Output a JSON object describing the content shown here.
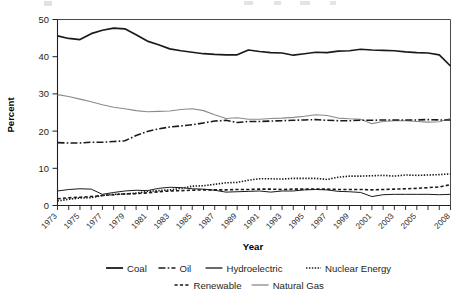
{
  "chart_data": {
    "type": "line",
    "title": "",
    "xlabel": "Year",
    "ylabel": "Percent",
    "ylim": [
      0,
      50
    ],
    "yticks": [
      0,
      10,
      20,
      30,
      40,
      50
    ],
    "grid": false,
    "legend_position": "bottom",
    "x": [
      1973,
      1974,
      1975,
      1976,
      1977,
      1978,
      1979,
      1980,
      1981,
      1982,
      1983,
      1984,
      1985,
      1986,
      1987,
      1988,
      1989,
      1990,
      1991,
      1992,
      1993,
      1994,
      1995,
      1996,
      1997,
      1998,
      1999,
      2000,
      2001,
      2002,
      2003,
      2004,
      2005,
      2006,
      2007,
      2008
    ],
    "xtick_labels": [
      "1973",
      "1975",
      "1977",
      "1979",
      "1981",
      "1983",
      "1985",
      "1987",
      "1989",
      "1991",
      "1993",
      "1995",
      "1997",
      "1999",
      "2001",
      "2003",
      "2005",
      "2008"
    ],
    "series": [
      {
        "name": "Coal",
        "style": "solid",
        "color": "#1a1a1a",
        "width": 1.7,
        "values": [
          45.6,
          44.9,
          44.6,
          46.2,
          47.1,
          47.7,
          47.5,
          45.9,
          44.2,
          43.2,
          42.1,
          41.6,
          41.2,
          40.8,
          40.6,
          40.5,
          40.5,
          41.8,
          41.4,
          41.1,
          41.0,
          40.4,
          40.8,
          41.2,
          41.1,
          41.5,
          41.6,
          42.0,
          41.8,
          41.7,
          41.6,
          41.3,
          41.1,
          41.0,
          40.5,
          37.5
        ]
      },
      {
        "name": "Oil",
        "style": "dashdot",
        "color": "#1a1a1a",
        "width": 1.6,
        "values": [
          16.9,
          16.8,
          16.8,
          17.0,
          17.0,
          17.2,
          17.4,
          18.8,
          19.9,
          20.6,
          21.1,
          21.4,
          21.7,
          22.2,
          22.7,
          22.9,
          22.3,
          22.6,
          22.6,
          22.7,
          22.8,
          22.9,
          23.0,
          23.1,
          22.9,
          22.8,
          22.8,
          22.9,
          22.9,
          23.0,
          23.0,
          23.0,
          23.0,
          23.1,
          23.0,
          23.0
        ]
      },
      {
        "name": "Hydroelectric",
        "style": "solid-thin",
        "color": "#1a1a1a",
        "width": 1.0,
        "values": [
          3.9,
          4.3,
          4.5,
          4.4,
          3.0,
          3.5,
          3.9,
          4.1,
          4.0,
          4.6,
          4.9,
          4.8,
          4.5,
          4.4,
          4.1,
          3.6,
          3.7,
          3.8,
          3.9,
          3.6,
          3.9,
          3.9,
          4.2,
          4.3,
          4.2,
          3.8,
          3.7,
          3.5,
          2.4,
          2.9,
          3.0,
          3.0,
          3.0,
          3.0,
          2.9,
          3.0
        ]
      },
      {
        "name": "Nuclear Energy",
        "style": "dotted",
        "color": "#1a1a1a",
        "width": 1.6,
        "values": [
          1.2,
          1.7,
          2.0,
          2.1,
          2.7,
          3.0,
          3.1,
          3.3,
          3.8,
          4.0,
          4.2,
          4.6,
          5.2,
          5.3,
          5.7,
          6.1,
          6.2,
          6.8,
          7.2,
          7.2,
          7.1,
          7.3,
          7.3,
          7.3,
          7.0,
          7.6,
          7.9,
          7.9,
          8.0,
          8.1,
          7.9,
          8.2,
          8.1,
          8.2,
          8.3,
          8.5
        ]
      },
      {
        "name": "Renewable",
        "style": "dashed",
        "color": "#1a1a1a",
        "width": 1.6,
        "values": [
          1.8,
          2.1,
          2.2,
          2.4,
          2.7,
          2.9,
          3.1,
          3.2,
          3.4,
          3.7,
          3.9,
          4.0,
          4.1,
          4.2,
          4.2,
          4.2,
          4.3,
          4.3,
          4.4,
          4.4,
          4.3,
          4.4,
          4.4,
          4.4,
          4.4,
          4.3,
          4.3,
          4.3,
          4.2,
          4.3,
          4.4,
          4.5,
          4.6,
          4.8,
          5.0,
          5.6
        ]
      },
      {
        "name": "Natural Gas",
        "style": "solid-gray",
        "color": "#8a8a8a",
        "width": 1.1,
        "values": [
          29.8,
          29.3,
          28.6,
          27.9,
          27.1,
          26.4,
          26.0,
          25.5,
          25.2,
          25.3,
          25.4,
          25.8,
          26.0,
          25.5,
          24.4,
          23.4,
          23.6,
          23.2,
          23.2,
          23.4,
          23.5,
          23.7,
          24.0,
          24.4,
          24.2,
          23.5,
          23.3,
          23.2,
          22.0,
          22.6,
          22.8,
          22.8,
          22.6,
          22.4,
          22.5,
          23.4
        ]
      }
    ]
  },
  "axes": {
    "y_title": "Percent",
    "x_title": "Year",
    "y_ticks": [
      "50",
      "40",
      "30",
      "20",
      "10",
      "0"
    ],
    "x_ticks": [
      "1973",
      "1975",
      "1977",
      "1979",
      "1981",
      "1983",
      "1985",
      "1987",
      "1989",
      "1991",
      "1993",
      "1995",
      "1997",
      "1999",
      "2001",
      "2003",
      "2005",
      "2008"
    ]
  },
  "legend": {
    "row1": [
      {
        "label": "Coal",
        "style": "solid"
      },
      {
        "label": "Oil",
        "style": "dashdot"
      },
      {
        "label": "Hydroelectric",
        "style": "solid-thin"
      },
      {
        "label": "Nuclear Energy",
        "style": "dotted"
      }
    ],
    "row2": [
      {
        "label": "Renewable",
        "style": "dashed"
      },
      {
        "label": "Natural Gas",
        "style": "solid-gray"
      }
    ]
  },
  "colors": {
    "axis": "#231f20",
    "series_dark": "#1a1a1a",
    "series_gray": "#8a8a8a",
    "background": "#ffffff"
  }
}
